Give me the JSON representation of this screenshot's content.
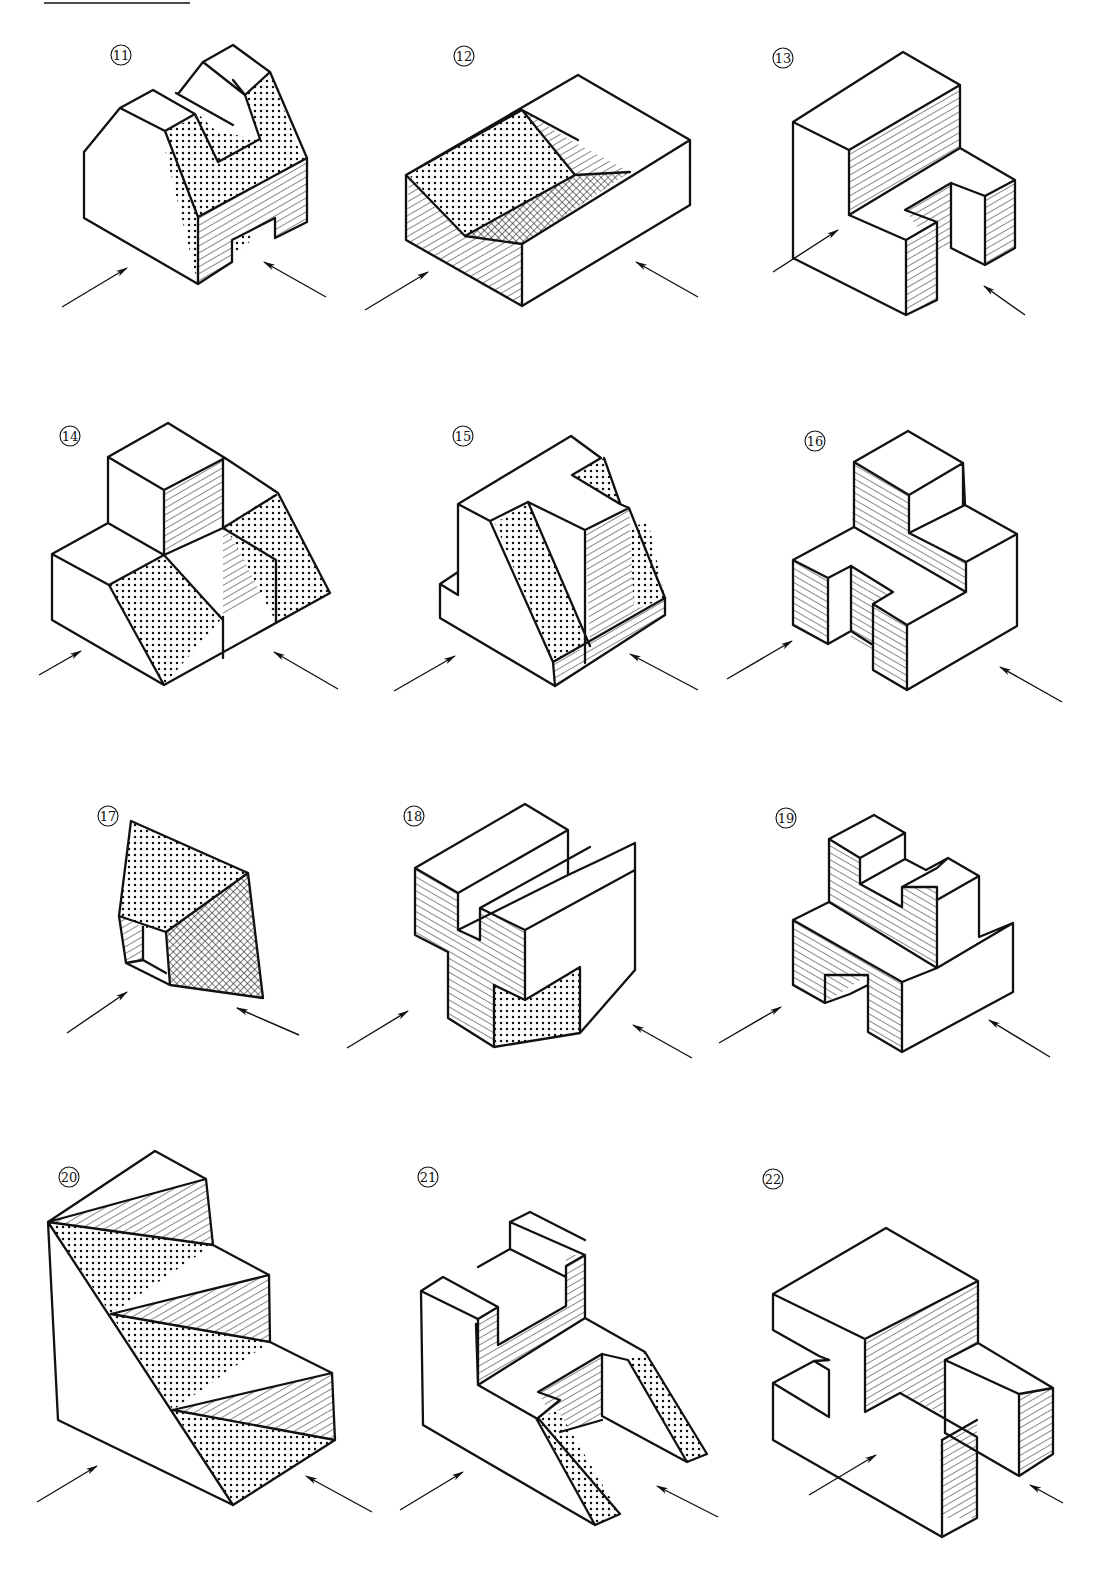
{
  "page": {
    "header_rule": {
      "x1": 44,
      "x2": 190,
      "y": 3
    },
    "legend": {
      "dotted": "inclined face (dot pattern)",
      "hatched": "normal face (diagonal hatching)",
      "crosshatched": "oblique face (cross-hatching)"
    }
  },
  "figures": [
    {
      "id": "11",
      "label": "⑪",
      "row": 1,
      "col": 1
    },
    {
      "id": "12",
      "label": "⑫",
      "row": 1,
      "col": 2
    },
    {
      "id": "13",
      "label": "⑬",
      "row": 1,
      "col": 3
    },
    {
      "id": "14",
      "label": "⑭",
      "row": 2,
      "col": 1
    },
    {
      "id": "15",
      "label": "⑮",
      "row": 2,
      "col": 2
    },
    {
      "id": "16",
      "label": "⑯",
      "row": 2,
      "col": 3
    },
    {
      "id": "17",
      "label": "⑰",
      "row": 3,
      "col": 1
    },
    {
      "id": "18",
      "label": "⑱",
      "row": 3,
      "col": 2
    },
    {
      "id": "19",
      "label": "⑲",
      "row": 3,
      "col": 3
    },
    {
      "id": "20",
      "label": "⑳",
      "row": 4,
      "col": 1
    },
    {
      "id": "21",
      "label": "㉑",
      "row": 4,
      "col": 2
    },
    {
      "id": "22",
      "label": "㉒",
      "row": 4,
      "col": 3
    }
  ],
  "colors": {
    "ink": "#111111",
    "paper": "#ffffff"
  }
}
